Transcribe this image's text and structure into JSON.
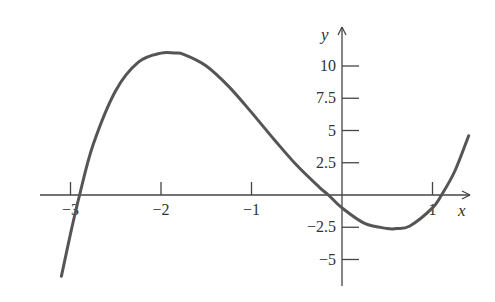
{
  "chart_data": {
    "type": "line",
    "title": "",
    "xlabel": "x",
    "ylabel": "y",
    "x_ticks": [
      -3,
      -2,
      -1,
      1
    ],
    "x_tick_labels": [
      "−3",
      "−2",
      "−1",
      "1"
    ],
    "y_ticks": [
      10,
      7.5,
      5,
      2.5,
      -2.5,
      -5
    ],
    "y_tick_labels": [
      "10",
      "7.5",
      "5",
      "2.5",
      "−2.5",
      "−5"
    ],
    "xlim": [
      -3.35,
      1.45
    ],
    "ylim": [
      -6.5,
      12
    ],
    "grid": false,
    "legend": null,
    "series": [
      {
        "name": "f(x)",
        "color": "#555555",
        "description": "cubic with local max near (-1.85, 11) and local min near (0.6, -2.6); zeros near x=-2.9, -0.15, 1.1",
        "x": [
          -3.1,
          -3.0,
          -2.9,
          -2.75,
          -2.5,
          -2.25,
          -2.0,
          -1.85,
          -1.75,
          -1.5,
          -1.25,
          -1.0,
          -0.75,
          -0.5,
          -0.25,
          -0.15,
          0.0,
          0.25,
          0.5,
          0.6,
          0.75,
          1.0,
          1.1,
          1.25,
          1.4
        ],
        "y": [
          -6.3,
          -3.0,
          0.0,
          3.9,
          8.1,
          10.3,
          11.0,
          11.0,
          10.9,
          10.0,
          8.4,
          6.4,
          4.3,
          2.3,
          0.6,
          0.0,
          -1.0,
          -2.2,
          -2.6,
          -2.6,
          -2.4,
          -1.0,
          0.0,
          1.9,
          4.6
        ]
      }
    ]
  },
  "axes": {
    "x_label": "x",
    "y_label": "y"
  }
}
